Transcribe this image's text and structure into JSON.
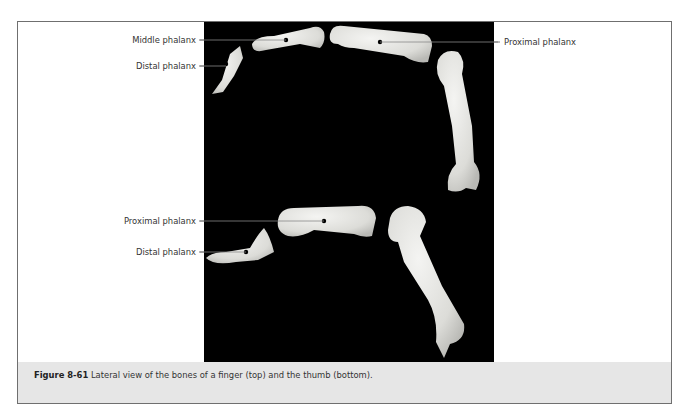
{
  "figure": {
    "number": "Figure 8-61",
    "caption": "Lateral view of the bones of a finger (top) and the thumb (bottom).",
    "colors": {
      "frame_border": "#6f6f6f",
      "photo_background": "#000000",
      "caption_background": "#e6e6e6",
      "bone": "#e8e8e6",
      "label_text": "#333333"
    }
  },
  "finger": {
    "labels": {
      "middle_phalanx": "Middle phalanx",
      "distal_phalanx": "Distal phalanx",
      "proximal_phalanx": "Proximal phalanx"
    }
  },
  "thumb": {
    "labels": {
      "proximal_phalanx": "Proximal phalanx",
      "distal_phalanx": "Distal phalanx"
    }
  }
}
